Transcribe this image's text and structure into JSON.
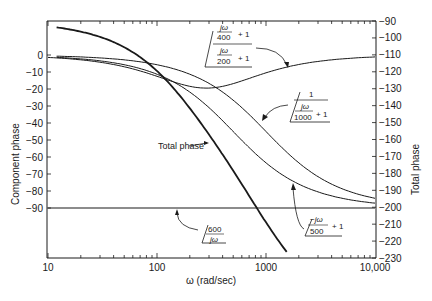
{
  "chart_data": {
    "type": "line",
    "title": "",
    "xlabel": "ω (rad/sec)",
    "ylabel_left": "Component phase",
    "ylabel_right": "Total phase",
    "xscale": "log",
    "xlim": [
      10,
      10000
    ],
    "xticks": [
      "10",
      "100",
      "1000",
      "10,000"
    ],
    "ylim_left": [
      -110,
      10
    ],
    "yticks_left": [
      "0",
      "-10",
      "-20",
      "-30",
      "-40",
      "-50",
      "-60",
      "-70",
      "-80",
      "-90"
    ],
    "ylim_right": [
      -230,
      -90
    ],
    "yticks_right": [
      "-90",
      "-100",
      "-110",
      "-120",
      "-130",
      "-140",
      "-150",
      "-160",
      "-170",
      "-180",
      "-190",
      "-200",
      "-210",
      "-220",
      "-230"
    ],
    "grid": false,
    "x": [
      10,
      20,
      50,
      100,
      200,
      283,
      500,
      1000,
      2000,
      5000,
      10000
    ],
    "series": [
      {
        "name": "600/jω",
        "axis": "left",
        "values": [
          -90,
          -90,
          -90,
          -90,
          -90,
          -90,
          -90,
          -90,
          -90,
          -90,
          -90
        ]
      },
      {
        "name": "(jω/400 + 1)/(jω/200 + 1)",
        "axis": "left",
        "values": [
          -1.4,
          -2.8,
          -6.8,
          -12.5,
          -18.4,
          -19.5,
          -15.7,
          -9.8,
          -5.3,
          -2.1,
          -1.1
        ]
      },
      {
        "name": "1/(jω/1000 + 1)",
        "axis": "left",
        "values": [
          -0.6,
          -1.1,
          -2.9,
          -5.7,
          -11.3,
          -15.8,
          -26.6,
          -45.0,
          -63.4,
          -78.7,
          -84.3
        ]
      },
      {
        "name": "(-jω/500 + 1)",
        "axis": "left",
        "values": [
          -1.1,
          -2.3,
          -5.7,
          -11.3,
          -21.8,
          -29.5,
          -45.0,
          -63.4,
          -76.0,
          -84.3,
          -87.1
        ]
      },
      {
        "name": "Total phase",
        "axis": "right",
        "values": [
          -93.1,
          -96.2,
          -105.4,
          -119.5,
          -141.5,
          -154.8,
          -177.3,
          -208.2,
          -234.7,
          -255.1,
          -262.5
        ]
      }
    ],
    "annotations": [
      {
        "label": "Total phase",
        "points_to": "Total phase"
      },
      {
        "label": "600/jω",
        "points_to": "600/jω"
      },
      {
        "label": "(jω/400 + 1)/(jω/200 + 1)",
        "points_to": "lead-lag"
      },
      {
        "label": "1/(jω/1000 + 1)",
        "points_to": "pole"
      },
      {
        "label": "-jω/500 + 1",
        "points_to": "rhp zero"
      }
    ]
  },
  "labels": {
    "xlabel": "ω (rad/sec)",
    "ylabel_left": "Component phase",
    "ylabel_right": "Total phase",
    "total_phase": "Total phase",
    "leadlag_num": "jω",
    "leadlag_num_den": "400",
    "leadlag_den_num": "jω",
    "leadlag_den_den": "200",
    "plus_one": "+ 1",
    "pole_num": "1",
    "pole_den_num": "jω",
    "pole_den_den": "1000",
    "zero_num": "−jω",
    "zero_den": "500",
    "int_num": "600",
    "int_den": "jω"
  },
  "colors": {
    "line": "#1a1a1a",
    "background": "#ffffff"
  }
}
